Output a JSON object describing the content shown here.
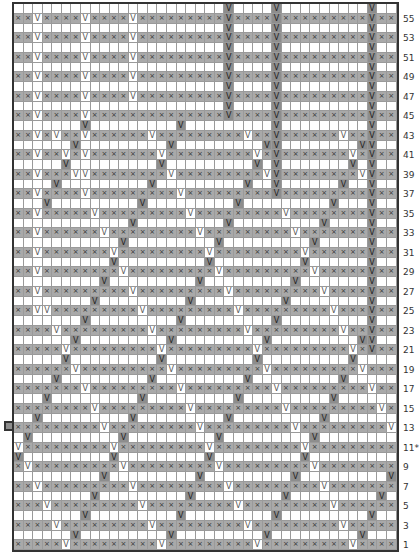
{
  "chart_data": {
    "type": "table",
    "columns": 40,
    "rows": 56,
    "cell_colors": {
      "odd_row": "#a9a9a9",
      "even_row": "#ffffff",
      "white_v": "#ffffff",
      "gray_v": "#8d8d8d",
      "border": "#333333"
    },
    "symbols": {
      "knit_x": "×",
      "slip_v": "V"
    },
    "row_labels": [
      "55",
      "53",
      "51",
      "49",
      "47",
      "45",
      "43",
      "41",
      "39",
      "37",
      "35",
      "33",
      "31",
      "29",
      "27",
      "25",
      "23",
      "21",
      "19",
      "17",
      "15",
      "13",
      "11*",
      "9",
      "7",
      "5",
      "3",
      "1"
    ],
    "lattice": {
      "period": 10,
      "white_base_col": 5,
      "gray_base_col": 5,
      "lattice_top_row": 44
    },
    "verticals": {
      "white": [
        {
          "col": 2,
          "from": 25
        },
        {
          "col": 7,
          "from": 37
        },
        {
          "col": 12,
          "from": 47
        }
      ],
      "gray": [
        {
          "col": 22,
          "from": 45
        },
        {
          "col": 27,
          "from": 37
        },
        {
          "col": 37,
          "from": 21
        }
      ]
    },
    "marker_row": "11*"
  }
}
